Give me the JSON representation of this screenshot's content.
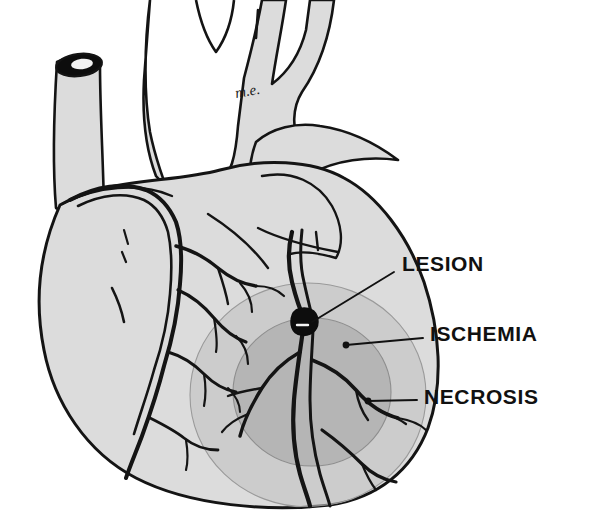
{
  "figure": {
    "signature": "m.e.",
    "background_color": "#ffffff"
  },
  "palette": {
    "ink": "#111111",
    "outline": "#141414",
    "myocardium_fill": "#dcdcdc",
    "vessel_fill": "#dcdcdc",
    "ischemia_fill": "#c2c2c2",
    "necrosis_fill": "#a9a9a9",
    "lesion_fill": "#0d0d0d",
    "lumen_fill": "#f2f2f2",
    "leader_line": "#111111"
  },
  "labels": [
    {
      "id": "lesion",
      "text": "LESION",
      "text_x": 402,
      "text_y": 265,
      "leader": {
        "x1": 394,
        "y1": 272,
        "x2": 312,
        "y2": 322
      },
      "description": "black occlusive plaque on the anterior interventricular (LAD) coronary artery"
    },
    {
      "id": "ischemia",
      "text": "ISCHEMIA",
      "text_x": 430,
      "text_y": 335,
      "leader": {
        "x1": 423,
        "y1": 338,
        "x2": 346,
        "y2": 345
      },
      "description": "outer lighter grey zone of reduced perfusion surrounding the infarct"
    },
    {
      "id": "necrosis",
      "text": "NECROSIS",
      "text_x": 424,
      "text_y": 398,
      "leader": {
        "x1": 417,
        "y1": 400,
        "x2": 368,
        "y2": 401
      },
      "description": "inner darker grey zone of dead myocardium"
    }
  ],
  "zones": {
    "ischemia": {
      "cx": 308,
      "cy": 395,
      "rx": 118,
      "ry": 112,
      "fill": "#c2c2c2",
      "opacity": 0.62
    },
    "necrosis": {
      "cx": 312,
      "cy": 392,
      "rx": 79,
      "ry": 74,
      "fill": "#a9a9a9",
      "opacity": 0.66
    },
    "lesion": {
      "cx": 305,
      "cy": 321,
      "r": 9,
      "fill": "#0d0d0d"
    }
  },
  "anatomy": [
    {
      "id": "aortic-arch",
      "name": "Aortic arch with brachiocephalic, left common carotid and left subclavian branches"
    },
    {
      "id": "superior-vena-cava",
      "name": "Superior vena cava stump, cut end"
    },
    {
      "id": "pulmonary-trunk",
      "name": "Pulmonary trunk"
    },
    {
      "id": "right-atrium",
      "name": "Right atrium and right atrial appendage"
    },
    {
      "id": "right-ventricle",
      "name": "Right ventricle"
    },
    {
      "id": "left-ventricle",
      "name": "Left ventricle"
    },
    {
      "id": "left-atrial-appendage",
      "name": "Left atrial appendage"
    },
    {
      "id": "right-coronary-artery",
      "name": "Right coronary artery and marginal branches"
    },
    {
      "id": "left-anterior-descending-artery",
      "name": "Left anterior descending coronary artery and diagonal branches"
    },
    {
      "id": "cardiac-apex",
      "name": "Cardiac apex"
    }
  ]
}
